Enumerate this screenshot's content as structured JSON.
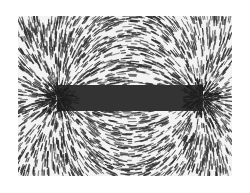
{
  "image": {
    "subject": "iron filings around a bar magnet showing magnetic field lines",
    "alt": "Iron filings aligned along magnetic field lines around a bar magnet",
    "colors": {
      "background": "#ffffff",
      "photo_background": "#f3f3f3",
      "filings": "#2e2e2e",
      "magnet": "#333333"
    }
  }
}
